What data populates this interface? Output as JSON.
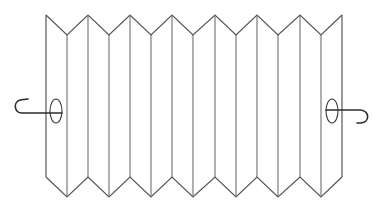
{
  "diagram": {
    "colors": {
      "background": "#ffffff",
      "fold_line": "#6e6e6e",
      "outline": "#555555",
      "handle": "#2b2b2b"
    },
    "geometry": {
      "peak_x": [
        46,
        88,
        130,
        172,
        215,
        257,
        300,
        342
      ],
      "valley_x": [
        67,
        109,
        151,
        193,
        236,
        278,
        321
      ],
      "top_peak_y": 15,
      "top_valley_y": 35,
      "bottom_peak_y": 177,
      "bottom_valley_y": 197
    },
    "handles": [
      {
        "side": "left",
        "ring_center": [
          56,
          111
        ],
        "ring_rx": 6,
        "ring_ry": 12
      },
      {
        "side": "right",
        "ring_center": [
          332,
          111
        ],
        "ring_rx": 6,
        "ring_ry": 12
      }
    ]
  }
}
